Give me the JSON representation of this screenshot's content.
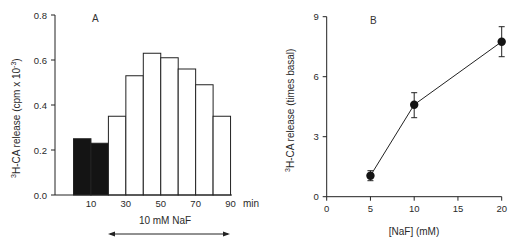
{
  "chart_data": [
    {
      "type": "bar",
      "panel_label": "A",
      "title": "",
      "xlabel": "min",
      "ylabel": "H-CA release (cpm x 10",
      "ylabel_superscript_prefix": "3",
      "ylabel_superscript_suffix": "-3",
      "ylabel_close": ")",
      "ylim": [
        0,
        0.8
      ],
      "yticks": [
        "0.0",
        "0.2",
        "0.4",
        "0.6",
        "0.8"
      ],
      "xtick_labels": [
        "10",
        "30",
        "50",
        "70",
        "90"
      ],
      "bins": [
        {
          "start": 0,
          "end": 10,
          "value": 0.25,
          "fill": "black"
        },
        {
          "start": 10,
          "end": 20,
          "value": 0.23,
          "fill": "black"
        },
        {
          "start": 20,
          "end": 30,
          "value": 0.35,
          "fill": "white"
        },
        {
          "start": 30,
          "end": 40,
          "value": 0.53,
          "fill": "white"
        },
        {
          "start": 40,
          "end": 50,
          "value": 0.63,
          "fill": "white"
        },
        {
          "start": 50,
          "end": 60,
          "value": 0.61,
          "fill": "white"
        },
        {
          "start": 60,
          "end": 70,
          "value": 0.56,
          "fill": "white"
        },
        {
          "start": 70,
          "end": 80,
          "value": 0.49,
          "fill": "white"
        },
        {
          "start": 80,
          "end": 90,
          "value": 0.35,
          "fill": "white"
        }
      ],
      "annotation": {
        "text": "10 mM NaF",
        "arrow": "double-headed",
        "span_min": [
          20,
          90
        ]
      },
      "grid": false
    },
    {
      "type": "line",
      "panel_label": "B",
      "title": "",
      "xlabel": "[NaF] (mM)",
      "ylabel": "H-CA release (times basal)",
      "ylabel_superscript_prefix": "3",
      "xlim": [
        0,
        20
      ],
      "ylim": [
        0,
        9
      ],
      "xticks": [
        "0",
        "5",
        "10",
        "15",
        "20"
      ],
      "yticks": [
        "0",
        "3",
        "6",
        "9"
      ],
      "series": [
        {
          "name": "NaF dose response",
          "x": [
            5,
            10,
            20
          ],
          "y": [
            1.05,
            4.6,
            7.75
          ],
          "error_low": [
            0.8,
            3.95,
            7.0
          ],
          "error_high": [
            1.3,
            5.2,
            8.5
          ]
        }
      ],
      "grid": false
    }
  ]
}
